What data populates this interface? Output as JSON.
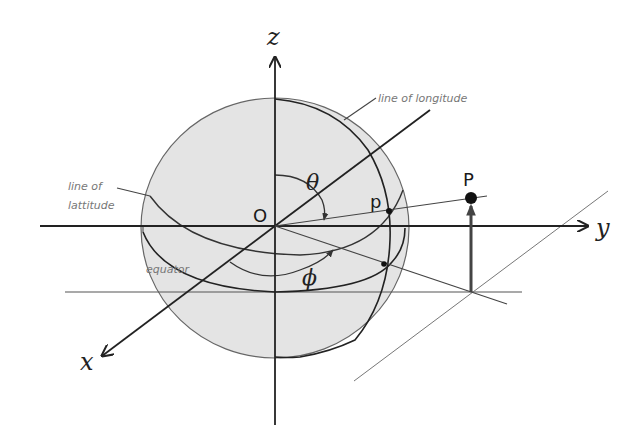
{
  "diagram": {
    "axes": {
      "x_label": "x",
      "y_label": "y",
      "z_label": "z"
    },
    "origin_label": "O",
    "point_on_sphere_label": "p",
    "point_label": "P",
    "angles": {
      "polar": "θ",
      "azimuthal": "ϕ"
    },
    "annotations": {
      "longitude": "line of longitude",
      "latitude_line1": "line of",
      "latitude_line2": "lattitude",
      "equator": "equator"
    },
    "colors": {
      "sphere_fill": "#e4e4e4",
      "line_dark": "#222222",
      "line_gray": "#666666",
      "label_gray": "#777777"
    }
  }
}
